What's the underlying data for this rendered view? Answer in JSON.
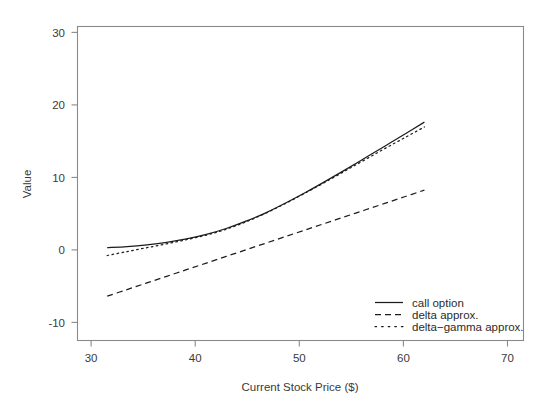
{
  "chart_data": {
    "type": "line",
    "title": "",
    "xlabel": "Current Stock Price ($)",
    "ylabel": "Value",
    "xlim": [
      27,
      72
    ],
    "ylim": [
      -13,
      32
    ],
    "xticks": [
      30,
      40,
      50,
      60,
      70
    ],
    "yticks": [
      -10,
      0,
      10,
      20,
      30
    ],
    "xtick_labels": [
      "30",
      "40",
      "50",
      "60",
      "70"
    ],
    "ytick_labels": [
      "-10",
      "0",
      "10",
      "20",
      "30"
    ],
    "grid": false,
    "legend_position": "bottom-right",
    "x": [
      30,
      32,
      34,
      36,
      38,
      40,
      42,
      44,
      46,
      48,
      50,
      52,
      54,
      56,
      58,
      60,
      62
    ],
    "series": [
      {
        "name": "call option",
        "style": "solid",
        "color": "#1c1c1c",
        "values": [
          0.3,
          0.45,
          0.7,
          1.05,
          1.55,
          2.2,
          3.05,
          4.1,
          5.3,
          6.7,
          8.2,
          9.8,
          11.45,
          13.15,
          14.85,
          16.55,
          18.3
        ]
      },
      {
        "name": "delta approx.",
        "style": "dashed",
        "color": "#1c1c1c",
        "values": [
          -6.65,
          -5.7,
          -4.75,
          -3.8,
          -2.85,
          -1.9,
          -0.95,
          0.0,
          0.95,
          1.9,
          2.85,
          3.8,
          4.75,
          5.7,
          6.65,
          7.6,
          8.55
        ]
      },
      {
        "name": "delta-gamma approx.",
        "style": "dotted",
        "color": "#1c1c1c",
        "values": [
          -0.82,
          -0.25,
          0.3,
          0.85,
          1.45,
          2.1,
          2.95,
          4.0,
          5.25,
          6.65,
          8.15,
          9.7,
          11.3,
          12.9,
          14.5,
          16.05,
          17.6
        ]
      }
    ],
    "legend": [
      {
        "label": "call option",
        "style": "solid"
      },
      {
        "label": "delta approx.",
        "style": "dashed"
      },
      {
        "label": "delta−gamma approx.",
        "style": "dotted"
      }
    ]
  }
}
